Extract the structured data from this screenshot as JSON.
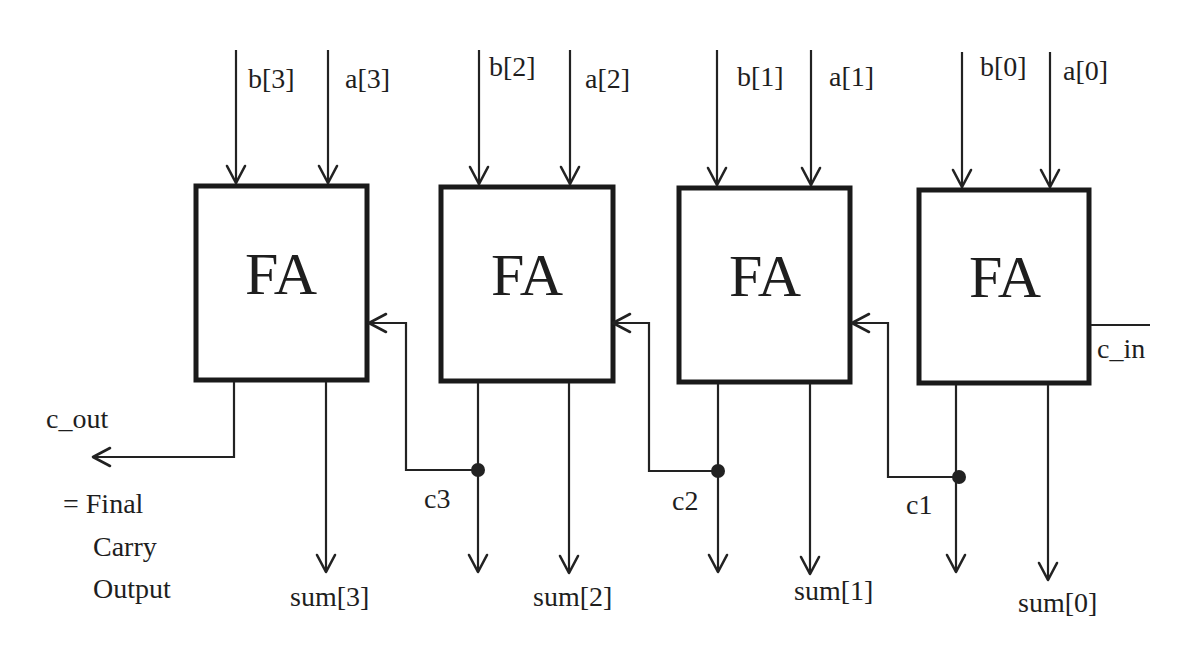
{
  "diagram": {
    "blocks": [
      {
        "id": "fa3",
        "label": "FA",
        "inputs": [
          "b[3]",
          "a[3]"
        ],
        "sum": "sum[3]"
      },
      {
        "id": "fa2",
        "label": "FA",
        "inputs": [
          "b[2]",
          "a[2]"
        ],
        "sum": "sum[2]"
      },
      {
        "id": "fa1",
        "label": "FA",
        "inputs": [
          "b[1]",
          "a[1]"
        ],
        "sum": "sum[1]"
      },
      {
        "id": "fa0",
        "label": "FA",
        "inputs": [
          "b[0]",
          "a[0]"
        ],
        "sum": "sum[0]"
      }
    ],
    "carries": {
      "c3": "c3",
      "c2": "c2",
      "c1": "c1",
      "c_in": "c_in",
      "c_out": "c_out"
    },
    "note": {
      "line1": "= Final",
      "line2": "Carry",
      "line3": "Output"
    },
    "colors": {
      "line": "#222222",
      "background": "#ffffff"
    }
  }
}
